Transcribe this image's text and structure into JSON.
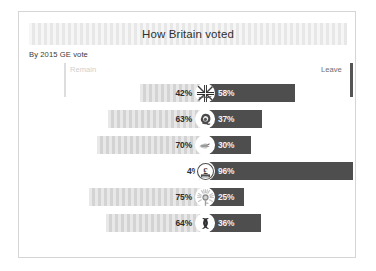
{
  "header": {
    "title": "How Britain voted",
    "subtitle": "By 2015 GE vote"
  },
  "axis": {
    "left_label": "Remain",
    "right_label": "Leave",
    "left_tick_color": "#dddddd",
    "right_tick_color": "#555555"
  },
  "colors": {
    "remain_segment": "#d6d6d6",
    "leave_segment": "#4e4e4e",
    "title_strip": "#ececec",
    "card_border": "#d5d5d5"
  },
  "chart_data": {
    "type": "bar",
    "title": "How Britain voted",
    "subtitle": "By 2015 GE vote",
    "xlabel": "",
    "ylabel": "",
    "orientation": "horizontal-diverging",
    "grid": false,
    "legend_position": "axis-ends",
    "series": [
      {
        "name": "Remain",
        "values": [
          42,
          63,
          70,
          4,
          75,
          64
        ]
      },
      {
        "name": "Leave",
        "values": [
          58,
          37,
          30,
          96,
          25,
          36
        ]
      }
    ],
    "categories": [
      "Conservative",
      "Labour",
      "Liberal Democrat",
      "UKIP",
      "Green",
      "SNP"
    ],
    "rows": [
      {
        "icon": "union-jack-icon",
        "remain": 42,
        "leave": 58,
        "remain_label": "42%",
        "leave_label": "58%"
      },
      {
        "icon": "labour-rose-icon",
        "remain": 63,
        "leave": 37,
        "remain_label": "63%",
        "leave_label": "37%"
      },
      {
        "icon": "libdem-bird-icon",
        "remain": 70,
        "leave": 30,
        "remain_label": "70%",
        "leave_label": "30%"
      },
      {
        "icon": "ukip-pound-icon",
        "remain": 4,
        "leave": 96,
        "remain_label": "4%",
        "leave_label": "96%"
      },
      {
        "icon": "green-sunflower-icon",
        "remain": 75,
        "leave": 25,
        "remain_label": "75%",
        "leave_label": "25%"
      },
      {
        "icon": "snp-thistle-icon",
        "remain": 64,
        "leave": 36,
        "remain_label": "64%",
        "leave_label": "36%"
      }
    ]
  }
}
